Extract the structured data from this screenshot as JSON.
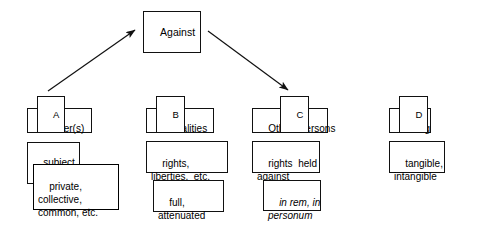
{
  "diagram": {
    "title_node": {
      "label": "Against"
    },
    "columns": [
      {
        "tag": "A",
        "head": "Holder(s)",
        "rows": [
          {
            "text": "subject",
            "italic": false
          },
          {
            "text": "private,\ncollective,\ncommon, etc.",
            "italic": false
          }
        ]
      },
      {
        "tag": "B",
        "head": "Modalities",
        "rows": [
          {
            "text": "rights,\nliberties,  etc.",
            "italic": false
          },
          {
            "text": "full,\nattenuated",
            "italic": false
          }
        ]
      },
      {
        "tag": "C",
        "head": "Other  Persons",
        "rows": [
          {
            "text": "rights  held\nagainst",
            "italic": false
          },
          {
            "text": "in rem, in\npersonum",
            "italic": true
          }
        ]
      },
      {
        "tag": "D",
        "head": "Thing",
        "rows": [
          {
            "text": "tangible,\nintangible",
            "italic": false
          }
        ]
      }
    ],
    "arrows": [
      {
        "name": "arrow-a-to-against",
        "from": "A",
        "to": "Against"
      },
      {
        "name": "arrow-against-to-c",
        "from": "Against",
        "to": "C"
      }
    ],
    "colors": {
      "stroke": "#111111",
      "background": "#ffffff",
      "text": "#000000"
    }
  }
}
